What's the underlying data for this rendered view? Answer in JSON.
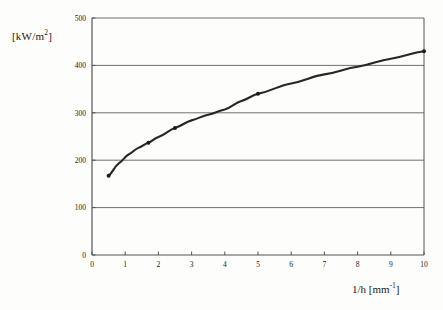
{
  "chart_data": {
    "type": "line",
    "title": "",
    "xlabel": "1/h [mm-1]",
    "ylabel": "[kW/m2]",
    "xlabel_main": "1/h [mm",
    "xlabel_sup": "-1",
    "xlabel_tail": "]",
    "ylabel_main": "[kW/m",
    "ylabel_sup": "2",
    "ylabel_tail": "]",
    "xlim": [
      0,
      10
    ],
    "ylim": [
      0,
      500
    ],
    "xticks": [
      0,
      1,
      2,
      3,
      4,
      5,
      6,
      7,
      8,
      9,
      10
    ],
    "xtick_labels": [
      "0",
      "1",
      "2",
      "3",
      "4",
      "5",
      "6",
      "7",
      "8",
      "9",
      "10"
    ],
    "yticks": [
      0,
      100,
      200,
      300,
      400,
      500
    ],
    "ytick_labels": [
      "0",
      "100",
      "200",
      "300",
      "400",
      "500"
    ],
    "grid": "horizontal",
    "legend": "none",
    "line_color": "#262626",
    "marker_color": "#1a1a1a",
    "axis_color": "#555555",
    "grid_color": "#6f6f6f",
    "background_color": "#fdfdfc",
    "series": [
      {
        "name": "heat flux",
        "x": [
          0.5,
          1.7,
          2.5,
          5.0,
          10.0
        ],
        "values": [
          167,
          237,
          268,
          340,
          430
        ],
        "curve_x": [
          0.5,
          0.8,
          1.1,
          1.4,
          1.7,
          2.0,
          2.5,
          3.0,
          3.5,
          4.0,
          4.5,
          5.0,
          6.0,
          7.0,
          8.0,
          9.0,
          10.0
        ],
        "curve_y": [
          167,
          193,
          212,
          226,
          237,
          249,
          268,
          284,
          296,
          307,
          325,
          340,
          362,
          381,
          397,
          414,
          430
        ]
      }
    ]
  }
}
